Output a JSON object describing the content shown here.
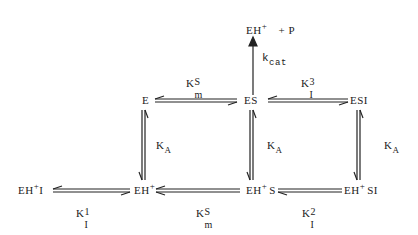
{
  "diagram": {
    "type": "kinetic-scheme",
    "nodes": {
      "product": {
        "base": "EH",
        "sup": "+",
        "rest": "+ P"
      },
      "E": {
        "base": "E"
      },
      "ES": {
        "base": "ES"
      },
      "ESI": {
        "base": "ESI"
      },
      "EHI": {
        "base": "EH",
        "sup": "+",
        "rest": "I"
      },
      "EH": {
        "base": "EH",
        "sup": "+"
      },
      "EHS": {
        "base": "EH",
        "sup": "+",
        "rest": "S"
      },
      "EHSI": {
        "base": "EH",
        "sup": "+",
        "rest": "SI"
      }
    },
    "labels": {
      "kcat": {
        "main": "k",
        "sub": "cat"
      },
      "KmS_top": {
        "main": "K",
        "sub": "m",
        "sup": "S"
      },
      "KI3": {
        "main": "K",
        "sub": "I",
        "sup": "3"
      },
      "KA_left": {
        "main": "K",
        "sub": "A"
      },
      "KA_mid": {
        "main": "K",
        "sub": "A"
      },
      "KA_right": {
        "main": "K",
        "sub": "A"
      },
      "KI1": {
        "main": "K",
        "sub": "I",
        "sup": "1"
      },
      "KmS_bottom": {
        "main": "K",
        "sub": "m",
        "sup": "S"
      },
      "KI2": {
        "main": "K",
        "sub": "I",
        "sup": "2"
      }
    },
    "edges": [
      {
        "from": "ES",
        "to": "product",
        "label": "kcat",
        "type": "irreversible"
      },
      {
        "from": "E",
        "to": "ES",
        "label": "KmS_top",
        "type": "equilibrium"
      },
      {
        "from": "ES",
        "to": "ESI",
        "label": "KI3",
        "type": "equilibrium"
      },
      {
        "from": "E",
        "to": "EH",
        "label": "KA_left",
        "type": "equilibrium"
      },
      {
        "from": "ES",
        "to": "EHS",
        "label": "KA_mid",
        "type": "equilibrium"
      },
      {
        "from": "ESI",
        "to": "EHSI",
        "label": "KA_right",
        "type": "equilibrium"
      },
      {
        "from": "EHI",
        "to": "EH",
        "label": "KI1",
        "type": "equilibrium"
      },
      {
        "from": "EH",
        "to": "EHS",
        "label": "KmS_bottom",
        "type": "equilibrium"
      },
      {
        "from": "EHS",
        "to": "EHSI",
        "label": "KI2",
        "type": "equilibrium"
      }
    ],
    "colors": {
      "ink": "#222222",
      "background": "#ffffff"
    }
  }
}
